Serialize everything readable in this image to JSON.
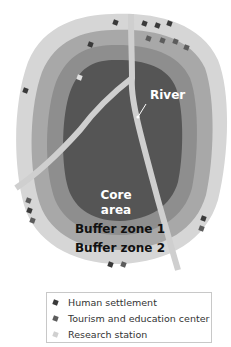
{
  "diagram": {
    "zones": [
      {
        "name": "Buffer zone 2",
        "color": "#d6d6d6"
      },
      {
        "name": "Buffer zone 1",
        "color": "#a8a8a8"
      },
      {
        "name": "Transition band",
        "color": "#8e8e8e"
      },
      {
        "name": "Core area",
        "color": "#5a5a5a"
      }
    ],
    "labels": {
      "river": "River",
      "core_line1": "Core",
      "core_line2": "area",
      "buffer1": "Buffer zone 1",
      "buffer2": "Buffer zone 2"
    },
    "colors": {
      "river": "#c9c9c9",
      "settlement": "#3a3a3a",
      "tourism": "#5c5c5c",
      "research": "#d0d0d0"
    }
  },
  "legend": {
    "items": [
      {
        "label": "Human settlement",
        "symbol": "settlement"
      },
      {
        "label": "Tourism and education center",
        "symbol": "tourism"
      },
      {
        "label": "Research station",
        "symbol": "research"
      }
    ]
  }
}
